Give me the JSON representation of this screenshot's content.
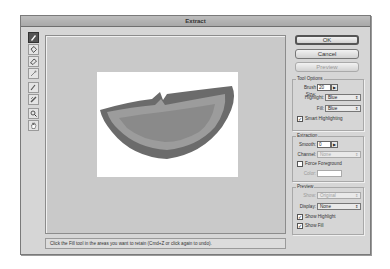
{
  "window": {
    "title": "Extract"
  },
  "tools": [
    {
      "name": "edge-highlighter",
      "active": true
    },
    {
      "name": "fill",
      "active": false
    },
    {
      "name": "eraser",
      "active": false
    },
    {
      "name": "eyedropper",
      "active": false
    },
    {
      "name": "cleanup",
      "active": false
    },
    {
      "name": "edge-touchup",
      "active": false
    },
    {
      "name": "zoom",
      "active": false
    },
    {
      "name": "hand",
      "active": false
    }
  ],
  "buttons": {
    "ok": "OK",
    "cancel": "Cancel",
    "preview": "Preview"
  },
  "tool_options": {
    "title": "Tool Options",
    "brush_size_label": "Brush Size:",
    "brush_size_value": "20",
    "highlight_label": "Highlight:",
    "highlight_value": "Blue",
    "fill_label": "Fill:",
    "fill_value": "Blue",
    "smart_highlighting_label": "Smart Highlighting",
    "smart_highlighting_checked": true
  },
  "extraction": {
    "title": "Extraction",
    "smooth_label": "Smooth:",
    "smooth_value": "0",
    "channel_label": "Channel:",
    "channel_value": "None",
    "force_foreground_label": "Force Foreground",
    "force_foreground_checked": false,
    "color_label": "Color:"
  },
  "preview_group": {
    "title": "Preview",
    "show_label": "Show:",
    "show_value": "Original",
    "display_label": "Display:",
    "display_value": "None",
    "show_highlight_label": "Show Highlight",
    "show_highlight_checked": true,
    "show_fill_label": "Show Fill",
    "show_fill_checked": true
  },
  "status": {
    "text": "Click the Fill tool in the areas you want to retain (Cmd+Z or click again to undo)."
  },
  "canvas": {
    "subject": "orange slice",
    "highlight_color": "#6b6b6b",
    "fill_color": "#9c9c9c"
  }
}
